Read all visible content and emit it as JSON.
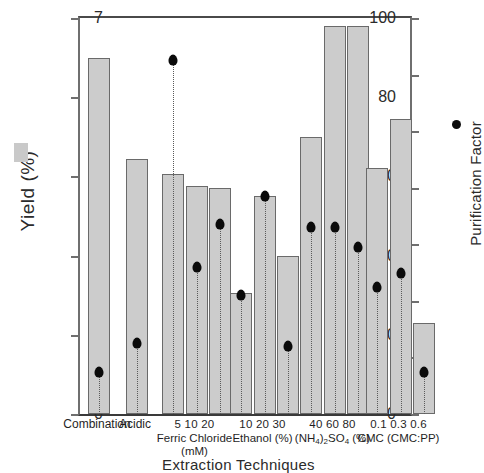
{
  "chart_data": {
    "type": "bar",
    "title": "",
    "xlabel": "Extraction Techniques",
    "ylabel": "Yield (%)",
    "y2label": "Purification Factor",
    "ylim": [
      0,
      100
    ],
    "y2lim": [
      0,
      7
    ],
    "yticks": [
      "0",
      "20",
      "40",
      "60",
      "80",
      "100"
    ],
    "y2ticks": [
      "0",
      "1",
      "2",
      "3",
      "4",
      "5",
      "6",
      "7"
    ],
    "grid": false,
    "legend": {
      "position": "outside-left-right",
      "bar_series_name": "Yield (%)",
      "dot_series_name": "Purification Factor",
      "bar_color": "#cccccc",
      "dot_color": "#0a0a0a"
    },
    "groups": [
      {
        "name": "Combination",
        "levels_line": "",
        "name_line2": "",
        "categories": [
          "Combination"
        ],
        "yield": [
          90.0
        ],
        "purification_factor": [
          0.75
        ]
      },
      {
        "name": "Acidic",
        "levels_line": "",
        "name_line2": "",
        "categories": [
          "Acidic"
        ],
        "yield": [
          64.5
        ],
        "purification_factor": [
          1.25
        ]
      },
      {
        "name": "Ferric Chloride",
        "levels_line": "5   10   20",
        "name_line2": "(mM)",
        "categories": [
          "5",
          "10",
          "20"
        ],
        "yield": [
          60.5,
          57.5,
          57.0
        ],
        "purification_factor": [
          6.25,
          2.6,
          3.35
        ]
      },
      {
        "name": "Ethanol (%)",
        "levels_line": "10 20 30",
        "name_line2": "",
        "categories": [
          "10",
          "20",
          "30"
        ],
        "yield": [
          30.5,
          55.0,
          40.0
        ],
        "purification_factor": [
          2.1,
          3.85,
          1.2
        ]
      },
      {
        "name": "(NH4)2SO4 (%)",
        "levels_line": "40 60 80",
        "name_line2": "",
        "categories": [
          "40",
          "60",
          "80"
        ],
        "yield": [
          70.0,
          98.0,
          98.0
        ],
        "purification_factor": [
          3.3,
          3.3,
          2.95
        ]
      },
      {
        "name": "CMC (CMC:PP)",
        "levels_line": "0.1 0.3 0.6",
        "name_line2": "",
        "categories": [
          "0.1",
          "0.3",
          "0.6"
        ],
        "yield": [
          62.0,
          74.5,
          23.0
        ],
        "purification_factor": [
          2.25,
          2.5,
          0.75
        ]
      }
    ]
  },
  "axis": {
    "left_title": "Yield (%)",
    "right_title": "Purification Factor",
    "bottom_title": "Extraction Techniques"
  },
  "xgroups": [
    {
      "levels": "",
      "name": "Combination",
      "name2": ""
    },
    {
      "levels": "",
      "name": "Acidic",
      "name2": ""
    },
    {
      "levels": "5   10   20",
      "name": "Ferric Chloride",
      "name2": "(mM)"
    },
    {
      "levels": "10 20 30",
      "name": "Ethanol (%)",
      "name2": ""
    },
    {
      "levels": "40 60 80",
      "name": "",
      "name2": ""
    },
    {
      "levels": "0.1 0.3 0.6",
      "name": "CMC (CMC:PP)",
      "name2": ""
    }
  ]
}
